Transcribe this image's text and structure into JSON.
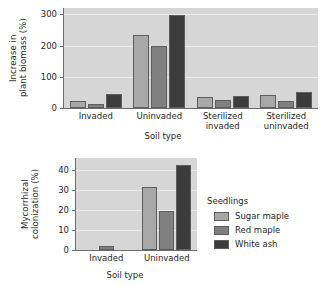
{
  "figure": {
    "background": "#ffffff"
  },
  "legend": {
    "title": "Seedlings",
    "position": "right",
    "entries": [
      {
        "label": "Sugar maple",
        "color": "#a8a8a8"
      },
      {
        "label": "Red maple",
        "color": "#808080"
      },
      {
        "label": "White ash",
        "color": "#3c3c3c"
      }
    ]
  },
  "chart_data": [
    {
      "id": "biomass",
      "type": "bar",
      "title": "",
      "xlabel": "Soil type",
      "ylabel": "Increase in\nplant biomass (%)",
      "categories": [
        "Invaded",
        "Uninvaded",
        "Sterilized\ninvaded",
        "Sterilized\nuninvaded"
      ],
      "ylim": [
        0,
        320
      ],
      "yticks": [
        0,
        100,
        200,
        300
      ],
      "ytick_labels": [
        "0",
        "100",
        "200",
        "300"
      ],
      "grid": true,
      "series": [
        {
          "name": "Sugar maple",
          "color": "#a8a8a8",
          "values": [
            24,
            235,
            34,
            43
          ]
        },
        {
          "name": "Red maple",
          "color": "#808080",
          "values": [
            14,
            197,
            26,
            21
          ]
        },
        {
          "name": "White ash",
          "color": "#3c3c3c",
          "values": [
            44,
            298,
            39,
            52
          ]
        }
      ]
    },
    {
      "id": "mycorrhizal",
      "type": "bar",
      "title": "",
      "xlabel": "Soil type",
      "ylabel": "Mycorrhizal\ncolonization (%)",
      "categories": [
        "Invaded",
        "Uninvaded"
      ],
      "ylim": [
        0,
        46
      ],
      "yticks": [
        0,
        10,
        20,
        30,
        40
      ],
      "ytick_labels": [
        "0",
        "10",
        "20",
        "30",
        "40"
      ],
      "grid": true,
      "series": [
        {
          "name": "Sugar maple",
          "color": "#a8a8a8",
          "values": [
            0,
            31.5
          ]
        },
        {
          "name": "Red maple",
          "color": "#808080",
          "values": [
            2,
            19.5
          ]
        },
        {
          "name": "White ash",
          "color": "#3c3c3c",
          "values": [
            0,
            42.5
          ]
        }
      ]
    }
  ]
}
